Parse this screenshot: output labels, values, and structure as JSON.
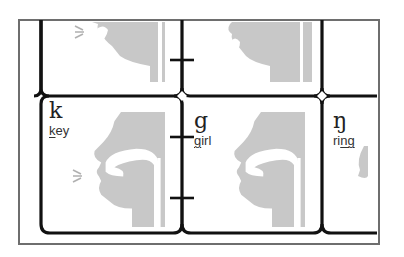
{
  "colors": {
    "frame": "#6e6e6e",
    "grid_line": "#111111",
    "head_fill": "#c8c8c8",
    "text": "#222222"
  },
  "cells": [
    {
      "symbol": "k",
      "word": "key",
      "underlined": "k",
      "rest": "ey",
      "voicing": "voiceless"
    },
    {
      "symbol": "g",
      "word": "girl",
      "underlined": "g",
      "rest": "irl",
      "voicing": "voiced"
    },
    {
      "symbol": "ŋ",
      "word": "ring",
      "underlined": "ng",
      "prefix": "ri",
      "voicing": "nasal"
    }
  ],
  "icons": {
    "head_profile": "vocal-tract-head-icon",
    "airflow": "airflow-lines-icon",
    "pair_marker": "i-beam-pair-connector-icon",
    "junction": "diamond-junction-icon"
  }
}
